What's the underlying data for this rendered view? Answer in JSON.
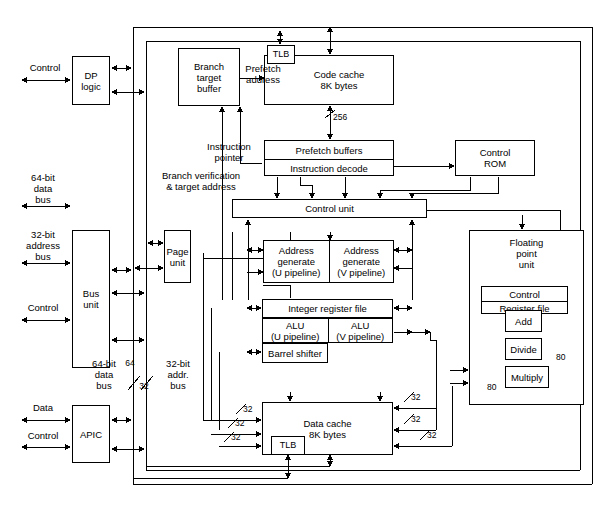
{
  "diagram": {
    "colors": {
      "line": "#000000",
      "fill": "#ffffff",
      "text": "#000000"
    }
  },
  "blocks": {
    "dp_logic": "DP\nlogic",
    "dp_logic_l1": "DP",
    "dp_logic_l2": "logic",
    "bus_unit_l1": "Bus",
    "bus_unit_l2": "unit",
    "page_unit_l1": "Page",
    "page_unit_l2": "unit",
    "apic": "APIC",
    "branch_target_buffer_l1": "Branch",
    "branch_target_buffer_l2": "target",
    "branch_target_buffer_l3": "buffer",
    "code_tlb": "TLB",
    "code_cache_l1": "Code cache",
    "code_cache_l2": "8K bytes",
    "prefetch_buffers": "Prefetch buffers",
    "instruction_decode": "Instruction decode",
    "control_rom_l1": "Control",
    "control_rom_l2": "ROM",
    "control_unit": "Control unit",
    "addr_gen_u_l1": "Address",
    "addr_gen_u_l2": "generate",
    "addr_gen_u_l3": "(U pipeline)",
    "addr_gen_v_l1": "Address",
    "addr_gen_v_l2": "generate",
    "addr_gen_v_l3": "(V pipeline)",
    "integer_register_file": "Integer register file",
    "alu_u_l1": "ALU",
    "alu_u_l2": "(U pipeline)",
    "alu_v_l1": "ALU",
    "alu_v_l2": "(V pipeline)",
    "barrel_shifter": "Barrel shifter",
    "data_cache_l1": "Data cache",
    "data_cache_l2": "8K bytes",
    "data_tlb": "TLB",
    "fpu_l1": "Floating",
    "fpu_l2": "point",
    "fpu_l3": "unit",
    "fpu_control": "Control",
    "fpu_register_file": "Register file",
    "fpu_add": "Add",
    "fpu_divide": "Divide",
    "fpu_multiply": "Multiply"
  },
  "labels": {
    "control_top": "Control",
    "data_bus_64_l1": "64-bit",
    "data_bus_64_l2": "data",
    "data_bus_64_l3": "bus",
    "address_bus_32_l1": "32-bit",
    "address_bus_32_l2": "address",
    "address_bus_32_l3": "bus",
    "control_mid": "Control",
    "data_left": "Data",
    "control_bottom": "Control",
    "prefetch_address_l1": "Prefetch",
    "prefetch_address_l2": "address",
    "instruction_pointer_l1": "Instruction",
    "instruction_pointer_l2": "pointer",
    "branch_verification_l1": "Branch verification",
    "branch_verification_l2": "& target address",
    "bus64_l1": "64-bit",
    "bus64_l2": "data",
    "bus64_l3": "bus",
    "bus32_l1": "32-bit",
    "bus32_l2": "addr.",
    "bus32_l3": "bus"
  },
  "bus_widths": {
    "w256": "256",
    "w64": "64",
    "w32": "32",
    "w32a": "32",
    "w32b": "32",
    "w32c": "32",
    "w32d": "32",
    "w32e": "32",
    "w32f": "32",
    "w32g": "32",
    "w80a": "80",
    "w80b": "80"
  }
}
